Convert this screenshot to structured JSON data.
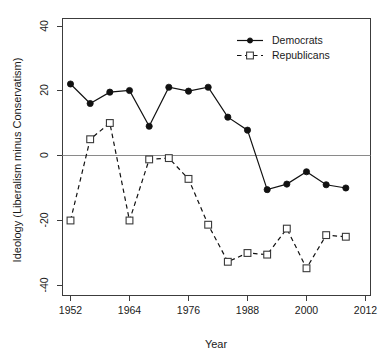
{
  "chart_data": {
    "type": "line",
    "title": "",
    "xlabel": "Year",
    "ylabel": "Ideology (Liberalism minus Conservatism)",
    "xlim": [
      1950,
      2014
    ],
    "ylim": [
      -44,
      42
    ],
    "xticks": [
      1952,
      1964,
      1976,
      1988,
      2000,
      2012
    ],
    "yticks": [
      40,
      20,
      0,
      -20,
      -40
    ],
    "grid": false,
    "zero_line": true,
    "legend_position": "top-right",
    "series": [
      {
        "name": "Democrats",
        "marker": "filled-circle",
        "linestyle": "solid",
        "color": "#111111",
        "x": [
          1952,
          1956,
          1960,
          1964,
          1968,
          1972,
          1976,
          1980,
          1984,
          1988,
          1992,
          1996,
          2000,
          2004,
          2008
        ],
        "values": [
          22,
          16,
          19.5,
          20,
          9,
          21,
          19.8,
          21,
          11.8,
          7.8,
          -10.5,
          -8.8,
          -5,
          -9,
          -10
        ]
      },
      {
        "name": "Republicans",
        "marker": "open-square",
        "linestyle": "dashed",
        "color": "#3a3a3a",
        "x": [
          1952,
          1956,
          1960,
          1964,
          1968,
          1972,
          1976,
          1980,
          1984,
          1988,
          1992,
          1996,
          2000,
          2004,
          2008
        ],
        "values": [
          -20,
          5,
          10,
          -20,
          -1.2,
          -0.8,
          -7.2,
          -21.3,
          -32.7,
          -30,
          -30.5,
          -22.5,
          -34.7,
          -24.5,
          -25
        ]
      }
    ]
  },
  "legend": {
    "entries": [
      {
        "label": "Democrats"
      },
      {
        "label": "Republicans"
      }
    ]
  },
  "axes": {
    "x_title": "Year",
    "y_title": "Ideology (Liberalism minus Conservatism)",
    "x_tick_labels": [
      "1952",
      "1964",
      "1976",
      "1988",
      "2000",
      "2012"
    ],
    "y_tick_labels": [
      "40",
      "20",
      "0",
      "-20",
      "-40"
    ]
  }
}
